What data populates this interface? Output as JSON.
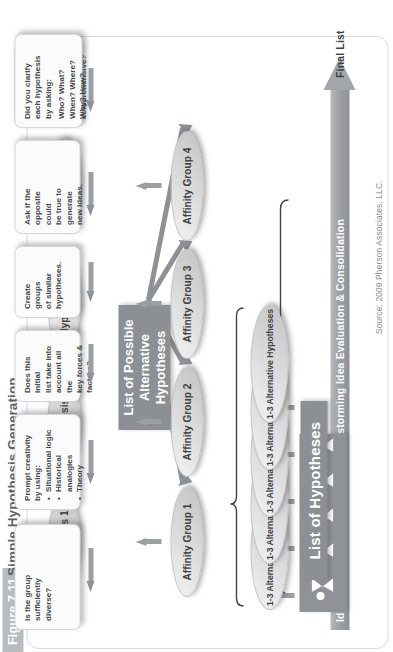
{
  "figure": {
    "badge": "Figure 7.11",
    "title": "Simple Hypothesis Generation",
    "source": "Source: 2009 Pherson Associates, LLC."
  },
  "phases": {
    "arrow_name": "process-flow-arrow",
    "labels": [
      "Idea Generation",
      "Structured Brainstorming",
      "Idea Evaluation & Consolidation",
      "Final List"
    ]
  },
  "flow": {
    "people_band": {
      "label": "brainstorming-group",
      "person_count": 5
    },
    "alternative_hypotheses": [
      "1-3 Alternative Hypotheses",
      "1-3 Alternative Hypotheses",
      "1-3 Alternative Hypotheses",
      "1-3 Alternative Hypotheses",
      "1-3 Alternative Hypotheses"
    ],
    "possible_list_box": {
      "line1": "List of Possible",
      "line2": "Alternative Hypotheses"
    },
    "affinity_groups": [
      "Affinity Group 1",
      "Affinity Group 2",
      "Affinity Group 3",
      "Affinity Group 4"
    ],
    "hypotheses": [
      "Hypothesis 1",
      "Hypothesis 2",
      "Hypothesis 3",
      "Hypothesis 4"
    ],
    "final_list_box": "List of Hypotheses"
  },
  "callouts": [
    {
      "id": "group-diversity",
      "lines": [
        "Is the group",
        "sufficiently",
        "diverse?"
      ]
    },
    {
      "id": "prompt-creativity",
      "lines": [
        "Prompt creativity",
        "by using:"
      ],
      "bullets": [
        "Situational logic",
        "Historical analogies",
        "Theory"
      ]
    },
    {
      "id": "initial-list-check",
      "lines": [
        "Does this initial",
        "list take into",
        "account all the",
        "key forces &",
        "factors?"
      ]
    },
    {
      "id": "create-groups",
      "lines": [
        "Create",
        "groups",
        "of similar",
        "hypotheses."
      ]
    },
    {
      "id": "opposite-test",
      "lines": [
        "Ask if the",
        "opposite",
        "could",
        "be true to",
        "generate",
        "new ideas."
      ]
    },
    {
      "id": "mutually-exclusive",
      "lines": [
        "Are the",
        "hypotheses",
        "mutually",
        "exclusive?",
        "Is the list",
        "comprehensive?"
      ]
    },
    {
      "id": "clarify-hypotheses",
      "lines": [
        "Did you clarify",
        "each hypothesis",
        "by asking:",
        "Who? What?",
        "When? Where?",
        "Why? How?"
      ]
    }
  ],
  "colors": {
    "band": "#8c8f93",
    "arrow": "#9b9ea2",
    "text_dark": "#3d4146",
    "panel_border": "#d8dade"
  }
}
